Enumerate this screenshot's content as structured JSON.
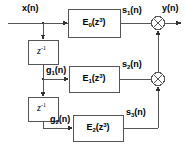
{
  "diagram": {
    "type": "block-diagram",
    "stroke_color": "#555555",
    "text_color": "#000000",
    "background": "#ffffff",
    "signals": {
      "input": "x(n)",
      "output": "y(n)",
      "branch1_tap": "g",
      "branch1_tap_sub": "1",
      "branch1_tap_tail": "(n)",
      "branch2_tap": "g",
      "branch2_tap_sub": "2",
      "branch2_tap_tail": "(n)",
      "out1": "s",
      "out1_sub": "1",
      "out1_tail": "(n)",
      "out2": "s",
      "out2_sub": "2",
      "out2_tail": "(n)",
      "out3": "s",
      "out3_sub": "3",
      "out3_tail": "(n)"
    },
    "blocks": [
      {
        "name": "filter-e0",
        "base": "E",
        "sub": "0",
        "arg_open": "(z",
        "arg_exp": "3",
        "arg_close": ")"
      },
      {
        "name": "filter-e1",
        "base": "E",
        "sub": "1",
        "arg_open": "(z",
        "arg_exp": "3",
        "arg_close": ")"
      },
      {
        "name": "filter-e2",
        "base": "E",
        "sub": "2",
        "arg_open": "(z",
        "arg_exp": "3",
        "arg_close": ")"
      }
    ],
    "delays": [
      {
        "name": "delay-1",
        "base": "z",
        "exp": "-1"
      },
      {
        "name": "delay-2",
        "base": "z",
        "exp": "-1"
      }
    ],
    "adders": [
      {
        "name": "adder-1",
        "symbol": "plus-cross"
      },
      {
        "name": "adder-2",
        "symbol": "plus-cross"
      }
    ]
  }
}
